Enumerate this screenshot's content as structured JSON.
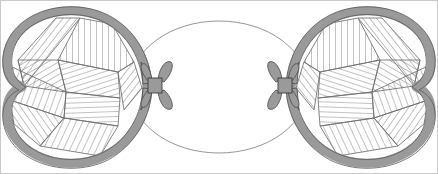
{
  "figure": {
    "title": "Two hatched heart-shaped lobes tied with bows to a central ellipse",
    "width": 438,
    "height": 174,
    "background_color": "#ffffff",
    "border_color": "#c9c9c9"
  },
  "palette": {
    "band_gray": "#9a9a9a",
    "band_outline": "#5a5a5a",
    "hatch_line": "#6e6e6e",
    "ellipse_stroke": "#8a8a8a",
    "bow_fill": "#9a9a9a",
    "bow_outline": "#4a4a4a",
    "interior_fill": "#ffffff",
    "frame": "#c9c9c9"
  },
  "shapes": {
    "center_ellipse": {
      "name": "center-ellipse",
      "cx": 219,
      "cy": 87,
      "rx": 89,
      "ry": 66,
      "stroke_width": 0.9,
      "fill": "#ffffff"
    },
    "left_lobe": {
      "name": "left-lobe",
      "label": "left heart lobe",
      "band_width": 9,
      "notch_side": "left",
      "tip_x": 148,
      "tip_y": 87,
      "extent_x": [
        7,
        150
      ],
      "extent_y": [
        12,
        162
      ],
      "hatch_patch_count": 9
    },
    "right_lobe": {
      "name": "right-lobe",
      "label": "right heart lobe",
      "band_width": 9,
      "notch_side": "right",
      "tip_x": 290,
      "tip_y": 87,
      "extent_x": [
        288,
        431
      ],
      "extent_y": [
        12,
        162
      ],
      "hatch_patch_count": 9
    },
    "left_bow": {
      "name": "left-bow-knot",
      "label": "left bow",
      "cx": 155,
      "cy": 84,
      "width": 30,
      "height": 44
    },
    "right_bow": {
      "name": "right-bow-knot",
      "label": "right bow",
      "cx": 285,
      "cy": 84,
      "width": 30,
      "height": 44
    }
  },
  "hatching": {
    "description": "Each lobe interior is divided into irregular quadrilateral patches; every patch is filled with parallel straight lines at a patch-specific angle, giving a patchwork or woven appearance.",
    "line_color": "#6e6e6e",
    "line_width": 0.85,
    "left_patches": [
      {
        "id": "L1",
        "angle_deg": 38,
        "spacing": 5.5
      },
      {
        "id": "L2",
        "angle_deg": 0,
        "spacing": 6.0
      },
      {
        "id": "L3",
        "angle_deg": 72,
        "spacing": 5.0
      },
      {
        "id": "L4",
        "angle_deg": 38,
        "spacing": 5.5
      },
      {
        "id": "L5",
        "angle_deg": 88,
        "spacing": 5.0
      },
      {
        "id": "L6",
        "angle_deg": 25,
        "spacing": 6.0
      },
      {
        "id": "L7",
        "angle_deg": 145,
        "spacing": 5.5
      },
      {
        "id": "L8",
        "angle_deg": 20,
        "spacing": 6.0
      },
      {
        "id": "L9",
        "angle_deg": 60,
        "spacing": 5.5
      }
    ],
    "right_patches": [
      {
        "id": "R1",
        "angle_deg": 142,
        "spacing": 5.5
      },
      {
        "id": "R2",
        "angle_deg": 180,
        "spacing": 6.0
      },
      {
        "id": "R3",
        "angle_deg": 108,
        "spacing": 5.0
      },
      {
        "id": "R4",
        "angle_deg": 142,
        "spacing": 5.5
      },
      {
        "id": "R5",
        "angle_deg": 92,
        "spacing": 5.0
      },
      {
        "id": "R6",
        "angle_deg": 155,
        "spacing": 6.0
      },
      {
        "id": "R7",
        "angle_deg": 35,
        "spacing": 5.5
      },
      {
        "id": "R8",
        "angle_deg": 160,
        "spacing": 6.0
      },
      {
        "id": "R9",
        "angle_deg": 120,
        "spacing": 5.5
      }
    ]
  }
}
